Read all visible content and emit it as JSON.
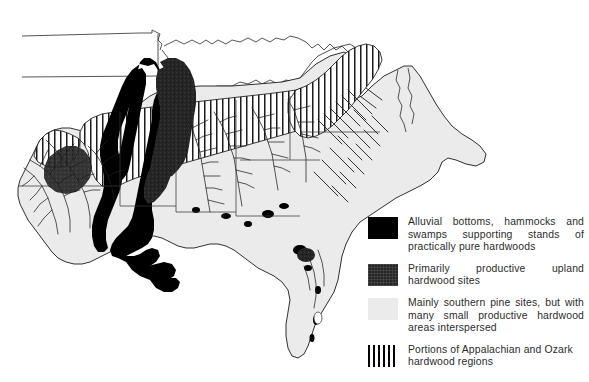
{
  "figure": {
    "kind": "thematic-map",
    "background_color": "#ffffff"
  },
  "map": {
    "land_fill": "#ebebeb",
    "alluvial_fill": "#000000",
    "upland_fill": "#262626",
    "hatch_color": "#000000",
    "outline_color": "#1a1a1a",
    "regions": [
      {
        "name": "mississippi-alluvial-valley",
        "class": "alluvial"
      },
      {
        "name": "ozark-upland",
        "class": "upland"
      },
      {
        "name": "southern-pine-belt",
        "class": "pine"
      },
      {
        "name": "appalachian-hatch",
        "class": "striped"
      },
      {
        "name": "ozark-hatch",
        "class": "striped"
      }
    ]
  },
  "legend": {
    "items": [
      {
        "swatch": "swatch-alluvial",
        "swatch_name": "legend-swatch-alluvial",
        "color": "#000000",
        "label": "Alluvial bottoms, hammocks and swamps supporting stands of practically pure hardwoods"
      },
      {
        "swatch": "swatch-upland",
        "swatch_name": "legend-swatch-upland",
        "color": "#262626",
        "label": "Primarily productive upland hardwood sites"
      },
      {
        "swatch": "swatch-pine",
        "swatch_name": "legend-swatch-pine",
        "color": "#ebebeb",
        "label": "Mainly southern pine sites, but with many small productive hardwood areas interspersed"
      },
      {
        "swatch": "swatch-striped",
        "swatch_name": "legend-swatch-striped",
        "color": "#000000",
        "label": "Portions of Appalachian and Ozark hardwood regions"
      }
    ]
  }
}
